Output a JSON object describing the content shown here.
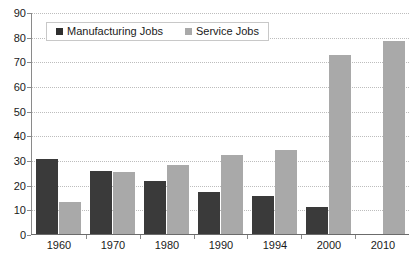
{
  "chart_data": {
    "type": "bar",
    "title": "",
    "xlabel": "",
    "ylabel": "",
    "ylim": [
      0,
      90
    ],
    "y_ticks": [
      0,
      10,
      20,
      30,
      40,
      50,
      60,
      70,
      80,
      90
    ],
    "grid": true,
    "legend_position": "top-left",
    "categories": [
      "1960",
      "1970",
      "1980",
      "1990",
      "1994",
      "2000",
      "2010"
    ],
    "series": [
      {
        "name": "Manufacturing Jobs",
        "color": "#3a3a3a",
        "values": [
          31,
          26,
          22,
          17.5,
          16,
          11.5,
          0.5
        ]
      },
      {
        "name": "Service Jobs",
        "color": "#a9a9a9",
        "values": [
          13.5,
          25.5,
          28.5,
          32.5,
          34.5,
          73,
          78.5
        ]
      }
    ]
  },
  "legend": {
    "items": [
      {
        "label": "Manufacturing Jobs"
      },
      {
        "label": "Service Jobs"
      }
    ]
  }
}
